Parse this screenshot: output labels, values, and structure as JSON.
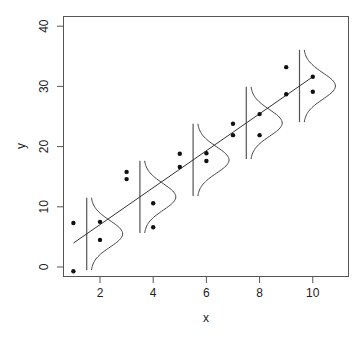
{
  "chart_data": {
    "type": "scatter",
    "title": "",
    "xlabel": "x",
    "ylabel": "y",
    "xlim": [
      0.6,
      11.3
    ],
    "ylim": [
      -1.6,
      41.5
    ],
    "xticks": [
      2,
      4,
      6,
      8,
      10
    ],
    "yticks": [
      0,
      10,
      20,
      30,
      40
    ],
    "grid": false,
    "legend": null,
    "points": [
      {
        "x": 1,
        "y": 7.3
      },
      {
        "x": 1,
        "y": -0.7
      },
      {
        "x": 2,
        "y": 7.5
      },
      {
        "x": 2,
        "y": 4.5
      },
      {
        "x": 3,
        "y": 15.8
      },
      {
        "x": 3,
        "y": 14.6
      },
      {
        "x": 4,
        "y": 10.6
      },
      {
        "x": 4,
        "y": 6.6
      },
      {
        "x": 5,
        "y": 18.8
      },
      {
        "x": 5,
        "y": 16.6
      },
      {
        "x": 6,
        "y": 18.9
      },
      {
        "x": 6,
        "y": 17.6
      },
      {
        "x": 7,
        "y": 23.8
      },
      {
        "x": 7,
        "y": 21.9
      },
      {
        "x": 8,
        "y": 25.4
      },
      {
        "x": 8,
        "y": 21.9
      },
      {
        "x": 9,
        "y": 33.2
      },
      {
        "x": 9,
        "y": 28.7
      },
      {
        "x": 10,
        "y": 31.6
      },
      {
        "x": 10,
        "y": 29.1
      }
    ],
    "regression_line": {
      "intercept": 0.9,
      "slope": 3.07,
      "x_from": 1,
      "x_to": 10
    },
    "normal_densities": {
      "x_positions": [
        1.5,
        3.5,
        5.5,
        7.5,
        9.5
      ],
      "half_range": 6,
      "sd": 2.2,
      "peak_width_x": 1.2
    }
  }
}
